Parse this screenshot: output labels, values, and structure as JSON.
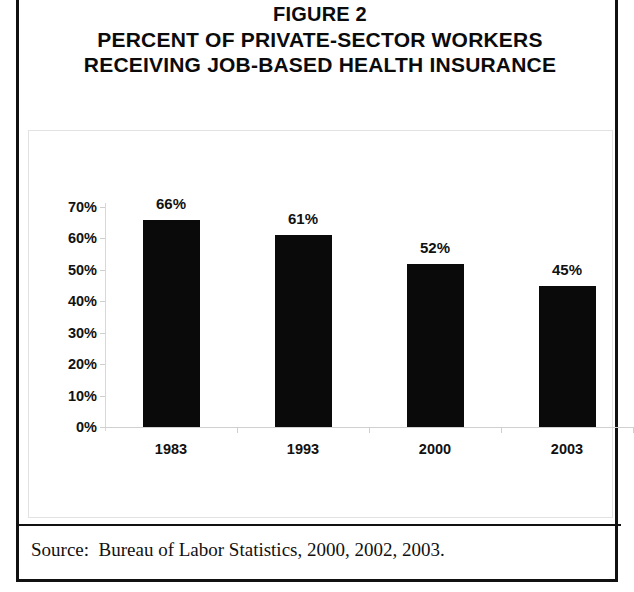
{
  "figure": {
    "title_lines": [
      "FIGURE 2",
      "PERCENT OF PRIVATE-SECTOR WORKERS",
      "RECEIVING JOB-BASED HEALTH INSURANCE"
    ],
    "source": "Source:  Bureau of Labor Statistics, 2000, 2002, 2003.",
    "frame_color": "#111111",
    "bar_color": "#0a0a0a",
    "plot_border_color": "#e2e2e2"
  },
  "chart_data": {
    "type": "bar",
    "title": "FIGURE 2 PERCENT OF PRIVATE-SECTOR WORKERS RECEIVING JOB-BASED HEALTH INSURANCE",
    "categories": [
      "1983",
      "1993",
      "2000",
      "2003"
    ],
    "values": [
      66,
      61,
      52,
      45
    ],
    "data_labels": [
      "66%",
      "61%",
      "52%",
      "45%"
    ],
    "xlabel": "",
    "ylabel": "",
    "ylim": [
      0,
      70
    ],
    "ytick_values": [
      70,
      60,
      50,
      40,
      30,
      20,
      10,
      0
    ],
    "ytick_labels": [
      "70%",
      "60%",
      "50%",
      "40%",
      "30%",
      "20%",
      "10%",
      "0%"
    ],
    "grid": false,
    "legend": false,
    "units": "percent",
    "series_name": "Percent of private-sector workers receiving job-based health insurance"
  }
}
